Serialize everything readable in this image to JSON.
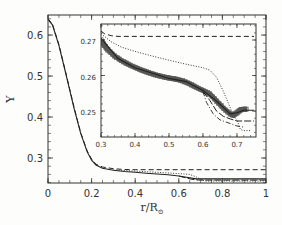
{
  "chart_data": [
    {
      "id": "main",
      "type": "line",
      "xlabel": "r/R",
      "xlabel_subscript": "⊙",
      "ylabel": "Y",
      "xlim": [
        0,
        1
      ],
      "ylim": [
        0.239,
        0.649
      ],
      "xticks": [
        0,
        0.2,
        0.4,
        0.6,
        0.8,
        1
      ],
      "xtick_labels": [
        "0",
        "0.2",
        "0.4",
        "0.6",
        "0.8",
        "1"
      ],
      "yticks": [
        0.3,
        0.4,
        0.5,
        0.6
      ],
      "ytick_labels": [
        "0.3",
        "0.4",
        "0.5",
        "0.6"
      ],
      "grid": false,
      "series": [
        {
          "name": "solid",
          "style": "solid",
          "x": [
            0,
            0.02,
            0.05,
            0.08,
            0.1,
            0.12,
            0.15,
            0.18,
            0.2,
            0.22,
            0.25,
            0.3,
            0.35,
            0.4,
            0.45,
            0.5,
            0.55,
            0.6,
            0.65,
            0.68,
            0.7,
            0.72,
            0.8,
            0.9,
            1.0
          ],
          "y": [
            0.638,
            0.625,
            0.575,
            0.51,
            0.465,
            0.42,
            0.36,
            0.315,
            0.295,
            0.283,
            0.275,
            0.27,
            0.267,
            0.265,
            0.263,
            0.261,
            0.259,
            0.256,
            0.252,
            0.249,
            0.249,
            0.249,
            0.249,
            0.249,
            0.249
          ]
        },
        {
          "name": "dashed",
          "style": "dashed",
          "x": [
            0,
            0.02,
            0.05,
            0.08,
            0.1,
            0.12,
            0.15,
            0.18,
            0.2,
            0.22,
            0.25,
            0.3,
            0.35,
            0.4,
            1.0
          ],
          "y": [
            0.64,
            0.627,
            0.577,
            0.512,
            0.467,
            0.422,
            0.362,
            0.317,
            0.297,
            0.285,
            0.278,
            0.274,
            0.272,
            0.2715,
            0.2715
          ]
        },
        {
          "name": "dotted",
          "style": "dotted",
          "x": [
            0.3,
            0.4,
            0.5,
            0.6,
            0.65,
            0.68,
            0.7,
            0.72,
            0.8,
            1.0
          ],
          "y": [
            0.271,
            0.268,
            0.265,
            0.262,
            0.26,
            0.254,
            0.248,
            0.244,
            0.244,
            0.244
          ]
        },
        {
          "name": "longdash",
          "style": "longdash",
          "x": [
            0.6,
            0.63,
            0.66,
            0.69,
            0.72,
            0.8,
            0.9,
            1.0
          ],
          "y": [
            0.256,
            0.252,
            0.248,
            0.246,
            0.246,
            0.246,
            0.246,
            0.246
          ]
        }
      ]
    },
    {
      "id": "inset",
      "type": "line",
      "xlim": [
        0.3,
        0.756
      ],
      "ylim": [
        0.2427,
        0.2745
      ],
      "xticks": [
        0.3,
        0.4,
        0.5,
        0.6,
        0.7
      ],
      "xtick_labels": [
        "0.3",
        "0.4",
        "0.5",
        "0.6",
        "0.7"
      ],
      "yticks": [
        0.25,
        0.26,
        0.27
      ],
      "ytick_labels": [
        "0.25",
        "0.26",
        "0.27"
      ],
      "grid": false,
      "series": [
        {
          "name": "dashed",
          "style": "dashed",
          "x": [
            0.3,
            0.31,
            0.33,
            0.35,
            0.4,
            0.5,
            0.6,
            0.7,
            0.75
          ],
          "y": [
            0.2725,
            0.2718,
            0.2712,
            0.271,
            0.271,
            0.271,
            0.271,
            0.271,
            0.271
          ]
        },
        {
          "name": "dotted",
          "style": "dotted",
          "x": [
            0.3,
            0.33,
            0.36,
            0.4,
            0.45,
            0.5,
            0.55,
            0.6,
            0.62,
            0.64,
            0.66,
            0.68,
            0.69,
            0.7,
            0.71,
            0.72,
            0.74
          ],
          "y": [
            0.2718,
            0.2695,
            0.268,
            0.2668,
            0.2655,
            0.2643,
            0.2632,
            0.2622,
            0.2615,
            0.2595,
            0.2555,
            0.251,
            0.2485,
            0.2475,
            0.2448,
            0.2445,
            0.2445
          ]
        },
        {
          "name": "symbols",
          "style": "markers",
          "x": [
            0.3,
            0.31,
            0.32,
            0.34,
            0.36,
            0.38,
            0.4,
            0.42,
            0.44,
            0.46,
            0.48,
            0.5,
            0.52,
            0.54,
            0.56,
            0.58,
            0.6,
            0.62,
            0.64,
            0.66,
            0.68,
            0.69,
            0.7,
            0.71,
            0.72,
            0.73
          ],
          "y": [
            0.27,
            0.2685,
            0.2672,
            0.2655,
            0.2642,
            0.2632,
            0.2623,
            0.2615,
            0.2608,
            0.2602,
            0.2597,
            0.2593,
            0.259,
            0.2585,
            0.2577,
            0.2567,
            0.2558,
            0.2548,
            0.2528,
            0.2508,
            0.2492,
            0.2488,
            0.2495,
            0.2503,
            0.2505,
            0.2505
          ]
        },
        {
          "name": "solid",
          "style": "solid",
          "x": [
            0.3,
            0.35,
            0.4,
            0.5,
            0.55,
            0.6,
            0.64,
            0.68,
            0.7,
            0.72,
            0.75
          ],
          "y": [
            0.2705,
            0.2648,
            0.2622,
            0.2592,
            0.2583,
            0.2558,
            0.2528,
            0.2492,
            0.2495,
            0.2502,
            0.2502
          ]
        },
        {
          "name": "longdash",
          "style": "longdash",
          "x": [
            0.6,
            0.62,
            0.64,
            0.66,
            0.68,
            0.7,
            0.72,
            0.75
          ],
          "y": [
            0.2555,
            0.253,
            0.25,
            0.2485,
            0.2478,
            0.2472,
            0.2472,
            0.2472
          ]
        },
        {
          "name": "dashdot",
          "style": "dashdot",
          "x": [
            0.6,
            0.61,
            0.63,
            0.65,
            0.68,
            0.7,
            0.72
          ],
          "y": [
            0.2555,
            0.2525,
            0.2492,
            0.2475,
            0.2465,
            0.2458,
            0.2455
          ]
        }
      ]
    }
  ],
  "main": {
    "ylabel": "Y",
    "xlabel": "r/R",
    "xlabel_sub": "⊙"
  }
}
